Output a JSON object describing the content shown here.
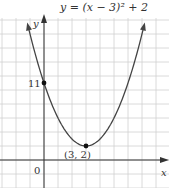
{
  "chart_data": {
    "type": "line",
    "title": "y = (x − 3)² + 2",
    "function": "y = (x - 3)^2 + 2",
    "xlabel": "x",
    "ylabel": "y",
    "origin_label": "0",
    "grid": true,
    "xlim": [
      -3,
      9
    ],
    "ylim": [
      -2,
      24
    ],
    "points": [
      {
        "x": 0,
        "y": 11,
        "label": "11"
      },
      {
        "x": 3,
        "y": 2,
        "label": "(3, 2)"
      }
    ],
    "x": [
      -1.3,
      -1,
      0,
      1,
      2,
      3,
      4,
      5,
      6,
      7,
      7.3
    ],
    "series": [
      {
        "name": "y = (x − 3)² + 2",
        "values": [
          20.49,
          18,
          11,
          6,
          3,
          2,
          3,
          6,
          11,
          18,
          20.49
        ]
      }
    ]
  },
  "colors": {
    "grid": "#d0d0d0",
    "axis": "#333333",
    "curve": "#444444",
    "point": "#111111"
  }
}
